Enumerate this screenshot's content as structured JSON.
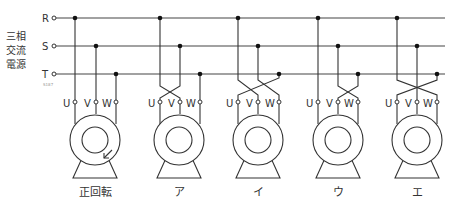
{
  "source": {
    "label_lines": [
      "三相",
      "交流",
      "電源"
    ],
    "phases": [
      "R",
      "S",
      "T"
    ],
    "watermark": "S187"
  },
  "terminal_labels": [
    "U",
    "V",
    "W"
  ],
  "motors": [
    {
      "caption": "正回転",
      "wiring": {
        "R": "U",
        "S": "V",
        "T": "W"
      },
      "rotation_arrow": true
    },
    {
      "caption": "ア",
      "wiring": {
        "R": "V",
        "S": "U",
        "T": "W"
      },
      "rotation_arrow": false
    },
    {
      "caption": "イ",
      "wiring": {
        "R": "V",
        "S": "W",
        "T": "U"
      },
      "rotation_arrow": false
    },
    {
      "caption": "ウ",
      "wiring": {
        "R": "U",
        "S": "W",
        "T": "V"
      },
      "rotation_arrow": false
    },
    {
      "caption": "エ",
      "wiring": {
        "R": "W",
        "S": "V",
        "T": "U"
      },
      "rotation_arrow": false
    }
  ]
}
